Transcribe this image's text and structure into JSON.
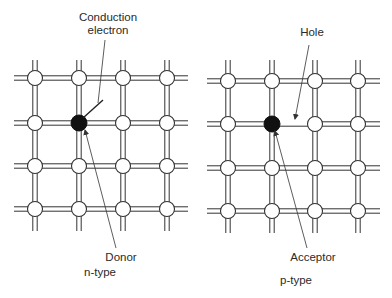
{
  "colors": {
    "line": "#333333",
    "dopant": "#111111",
    "node_fill": "#ffffff",
    "text": "#2a2a2a"
  },
  "panels": [
    {
      "id": "n-type",
      "title": "n-type",
      "title_pos": [
        100,
        272
      ],
      "columns": [
        35,
        79,
        123,
        167
      ],
      "rows": [
        78,
        123,
        166,
        209
      ],
      "x_range": [
        14,
        188
      ],
      "y_range": [
        60,
        231
      ],
      "dopant": {
        "col": 1,
        "row": 1,
        "label": "Donor",
        "label_pos": [
          121,
          257
        ]
      },
      "annotation": {
        "label": "Conduction\nelectron",
        "label_pos": [
          108,
          11
        ]
      },
      "missing_bond": null
    },
    {
      "id": "p-type",
      "title": "p-type",
      "title_pos": [
        296,
        280
      ],
      "columns": [
        228,
        272,
        315,
        358
      ],
      "rows": [
        81,
        124,
        168,
        211
      ],
      "x_range": [
        207,
        380
      ],
      "y_range": [
        60,
        233
      ],
      "dopant": {
        "col": 1,
        "row": 1,
        "label": "Acceptor",
        "label_pos": [
          313,
          257
        ]
      },
      "annotation": {
        "label": "Hole",
        "label_pos": [
          312,
          26
        ]
      },
      "missing_bond": {
        "row": 1,
        "from_col": 1,
        "to_col": 2
      }
    }
  ],
  "labels": {
    "conduction_electron_line1": "Conduction",
    "conduction_electron_line2": "electron",
    "donor": "Donor",
    "n_type": "n-type",
    "hole": "Hole",
    "acceptor": "Acceptor",
    "p_type": "p-type"
  }
}
